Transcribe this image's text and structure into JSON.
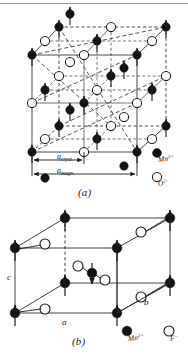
{
  "figure": {
    "kind": "crystal-magnetic-structure-diagram",
    "panels": [
      {
        "id": "a",
        "caption": "(a)",
        "compound": "MnO",
        "lattice": "face-centred cubic (rocksalt)",
        "dimension_labels": [
          {
            "name": "a-crystal",
            "text_main": "a",
            "text_sub": "cryst."
          },
          {
            "name": "a-magnetic",
            "text_main": "a",
            "text_sub": "magn."
          }
        ],
        "legend": [
          {
            "marker": "filled-circle",
            "text_main": "Mn",
            "text_sup": "2+"
          },
          {
            "marker": "open-circle",
            "text_main": "O",
            "text_sup": "2−"
          }
        ]
      },
      {
        "id": "b",
        "caption": "(b)",
        "compound": "MnF2",
        "lattice": "body-centred tetragonal (rutile)",
        "axis_labels": [
          {
            "name": "axis-a",
            "text": "a"
          },
          {
            "name": "axis-b",
            "text": "b"
          },
          {
            "name": "axis-c",
            "text": "c"
          }
        ],
        "legend": [
          {
            "marker": "filled-circle",
            "text_main": "Mn",
            "text_sup": "2+"
          },
          {
            "marker": "open-circle",
            "text_main": "F",
            "text_sup": "−"
          }
        ]
      }
    ],
    "colors": {
      "ink": "#1a1a1a",
      "line": "#2b2b2b",
      "dashed": "#3a3a3a",
      "fill_cation": "#111111",
      "fill_anion": "#ffffff",
      "rule": "#9a9a9a",
      "background": "#ffffff"
    }
  }
}
